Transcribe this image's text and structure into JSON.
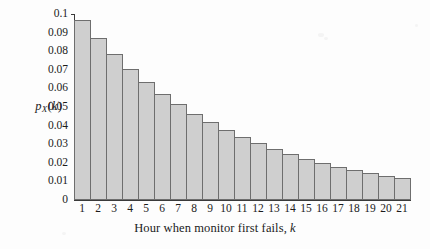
{
  "chart_data": {
    "type": "bar",
    "title": "",
    "subtitle": "",
    "xlabel": "Hour when monitor first fails, k",
    "xlabel_parts": {
      "text": "Hour when monitor first fails,",
      "italic_var": "k"
    },
    "ylabel": "p_X(k)",
    "ylabel_parts": {
      "base": "p",
      "subscript": "X",
      "open": "(",
      "var": "k",
      "close": ")"
    },
    "categories": [
      1,
      2,
      3,
      4,
      5,
      6,
      7,
      8,
      9,
      10,
      11,
      12,
      13,
      14,
      15,
      16,
      17,
      18,
      19,
      20,
      21
    ],
    "xtick_labels": [
      "1",
      "2",
      "3",
      "4",
      "5",
      "6",
      "7",
      "8",
      "9",
      "10",
      "11",
      "12",
      "13",
      "14",
      "15",
      "16",
      "17",
      "18",
      "19",
      "20",
      "21"
    ],
    "values": [
      0.0968,
      0.0871,
      0.0784,
      0.0706,
      0.0635,
      0.0572,
      0.0514,
      0.0463,
      0.0417,
      0.0375,
      0.0337,
      0.0304,
      0.0273,
      0.0246,
      0.0221,
      0.0199,
      0.0179,
      0.0161,
      0.0145,
      0.0131,
      0.0118
    ],
    "ytick_labels": [
      "0.1",
      "0.09",
      "0.08",
      "0.07",
      "0.06",
      "0.05",
      "0.04",
      "0.03",
      "0.02",
      "0.01",
      "0"
    ],
    "ytick_values": [
      0.1,
      0.09,
      0.08,
      0.07,
      0.06,
      0.05,
      0.04,
      0.03,
      0.02,
      0.01,
      0
    ],
    "ylim": [
      0,
      0.1
    ],
    "xlim": [
      0.5,
      21.5
    ],
    "grid": false,
    "legend": false,
    "legend_position": "none",
    "bar_fill_color": "#cfcfcf",
    "bar_edge_color": "#6e6e6e",
    "axis_color": "#3a3a3a",
    "background_color": "#fdfdfd",
    "annotations": []
  }
}
